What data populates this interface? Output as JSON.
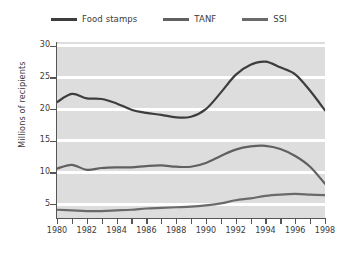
{
  "chart_data": {
    "type": "line",
    "title": "",
    "subtitle": "",
    "xlabel": "",
    "ylabel": "Millions of recipients",
    "x": [
      1980,
      1981,
      1982,
      1983,
      1984,
      1985,
      1986,
      1987,
      1988,
      1989,
      1990,
      1991,
      1992,
      1993,
      1994,
      1995,
      1996,
      1997,
      1998
    ],
    "xlim": [
      1980,
      1998
    ],
    "ylim": [
      2.8,
      30.6
    ],
    "yticks": [
      5,
      10,
      15,
      20,
      25,
      30
    ],
    "xticks": [
      1980,
      1981,
      1982,
      1983,
      1984,
      1985,
      1986,
      1987,
      1988,
      1989,
      1990,
      1991,
      1992,
      1993,
      1994,
      1995,
      1996,
      1997,
      1998
    ],
    "xtick_labels": [
      "1980",
      "",
      "1982",
      "",
      "1984",
      "",
      "1986",
      "",
      "1988",
      "",
      "1990",
      "",
      "1992",
      "",
      "1994",
      "",
      "1996",
      "",
      "1998"
    ],
    "grid": "horizontal-white-bands",
    "legend_position": "top-center",
    "series": [
      {
        "name": "Food stamps",
        "color": "#3d3d3d",
        "values": [
          21.1,
          22.4,
          21.7,
          21.6,
          20.9,
          19.9,
          19.4,
          19.1,
          18.7,
          18.8,
          20.0,
          22.6,
          25.4,
          27.0,
          27.5,
          26.6,
          25.5,
          22.9,
          19.8
        ]
      },
      {
        "name": "TANF",
        "color": "#606060",
        "values": [
          10.6,
          11.2,
          10.4,
          10.7,
          10.8,
          10.8,
          11.0,
          11.1,
          10.9,
          10.9,
          11.5,
          12.6,
          13.6,
          14.1,
          14.2,
          13.7,
          12.6,
          10.9,
          8.2
        ]
      },
      {
        "name": "SSI",
        "color": "#6a6a6a",
        "values": [
          4.1,
          4.0,
          3.9,
          3.9,
          4.0,
          4.1,
          4.3,
          4.4,
          4.5,
          4.6,
          4.8,
          5.1,
          5.6,
          5.9,
          6.3,
          6.5,
          6.6,
          6.5,
          6.4
        ]
      }
    ]
  },
  "legend": {
    "items": [
      {
        "label": "Food stamps",
        "color": "#3d3d3d"
      },
      {
        "label": "TANF",
        "color": "#606060"
      },
      {
        "label": "SSI",
        "color": "#6a6a6a"
      }
    ]
  },
  "axes": {
    "y_title": "Millions of recipients",
    "y_tick_labels": [
      "30",
      "25",
      "20",
      "15",
      "10",
      "5"
    ],
    "x_tick_labels": [
      "1980",
      "1982",
      "1984",
      "1986",
      "1988",
      "1990",
      "1992",
      "1994",
      "1996",
      "1998"
    ]
  }
}
